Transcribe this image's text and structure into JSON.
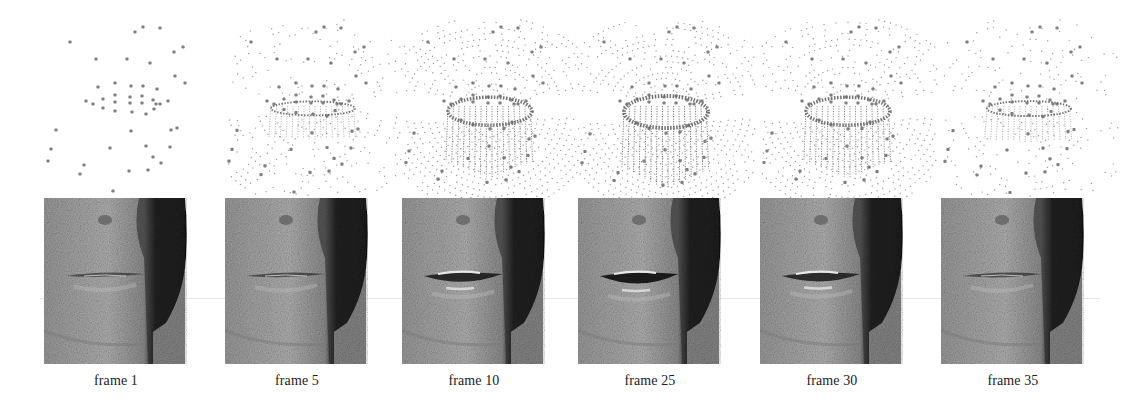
{
  "figure": {
    "colors": {
      "background": "#ffffff",
      "marker": "#6a6a6a",
      "mesh_dot": "#9a9a9a",
      "skin_light": "#a9a9a9",
      "skin_shadow": "#1e1e1e",
      "caption": "#222222"
    },
    "panels": [
      {
        "label": "frame 1",
        "x": 48,
        "open": 0.0,
        "mesh": 0.0,
        "mouth": 0.05
      },
      {
        "label": "frame 5",
        "x": 229,
        "open": 0.1,
        "mesh": 0.45,
        "mouth": 0.1
      },
      {
        "label": "frame 10",
        "x": 406,
        "open": 0.8,
        "mesh": 1.0,
        "mouth": 0.75
      },
      {
        "label": "frame 25",
        "x": 582,
        "open": 1.0,
        "mesh": 1.0,
        "mouth": 1.0
      },
      {
        "label": "frame 30",
        "x": 764,
        "open": 0.8,
        "mesh": 0.9,
        "mouth": 0.7
      },
      {
        "label": "frame 35",
        "x": 945,
        "open": 0.15,
        "mesh": 0.35,
        "mouth": 0.12
      }
    ],
    "markers": [
      [
        91,
        32
      ],
      [
        99,
        27
      ],
      [
        116,
        28
      ],
      [
        26,
        42
      ],
      [
        130,
        52
      ],
      [
        139,
        47
      ],
      [
        52,
        59
      ],
      [
        83,
        59
      ],
      [
        106,
        63
      ],
      [
        131,
        76
      ],
      [
        141,
        83
      ],
      [
        54,
        87
      ],
      [
        71,
        83
      ],
      [
        87,
        86
      ],
      [
        99,
        86
      ],
      [
        113,
        89
      ],
      [
        42,
        101
      ],
      [
        49,
        104
      ],
      [
        59,
        99
      ],
      [
        59,
        108
      ],
      [
        71,
        95
      ],
      [
        71,
        102
      ],
      [
        86,
        97
      ],
      [
        86,
        103
      ],
      [
        98,
        96
      ],
      [
        98,
        103
      ],
      [
        109,
        100
      ],
      [
        112,
        104
      ],
      [
        116,
        104
      ],
      [
        124,
        101
      ],
      [
        71,
        111
      ],
      [
        88,
        112
      ],
      [
        102,
        114
      ],
      [
        110,
        109
      ],
      [
        12,
        130
      ],
      [
        87,
        131
      ],
      [
        127,
        130
      ],
      [
        133,
        128
      ],
      [
        7,
        149
      ],
      [
        66,
        148
      ],
      [
        102,
        146
      ],
      [
        126,
        147
      ],
      [
        4,
        161
      ],
      [
        40,
        165
      ],
      [
        109,
        157
      ],
      [
        117,
        163
      ],
      [
        36,
        174
      ],
      [
        85,
        171
      ],
      [
        104,
        170
      ],
      [
        69,
        191
      ]
    ]
  }
}
